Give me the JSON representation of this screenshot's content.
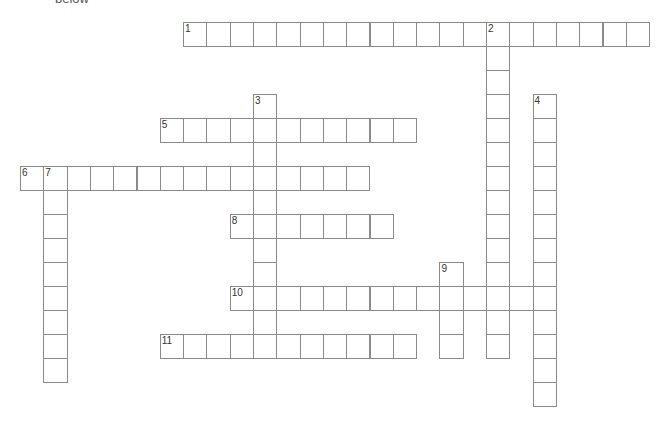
{
  "header": {
    "text": "below"
  },
  "grid": {
    "origin_x": 20,
    "origin_y": 22,
    "cell_w": 23.3,
    "cell_h": 24
  },
  "entries": [
    {
      "number": "1",
      "direction": "across",
      "row": 0,
      "col": 7,
      "length": 20
    },
    {
      "number": "2",
      "direction": "down",
      "row": 0,
      "col": 20,
      "length": 14
    },
    {
      "number": "3",
      "direction": "down",
      "row": 3,
      "col": 10,
      "length": 11
    },
    {
      "number": "4",
      "direction": "down",
      "row": 3,
      "col": 22,
      "length": 13
    },
    {
      "number": "5",
      "direction": "across",
      "row": 4,
      "col": 6,
      "length": 11
    },
    {
      "number": "6",
      "direction": "across",
      "row": 6,
      "col": 0,
      "length": 15
    },
    {
      "number": "7",
      "direction": "down",
      "row": 6,
      "col": 1,
      "length": 9
    },
    {
      "number": "8",
      "direction": "across",
      "row": 8,
      "col": 9,
      "length": 7
    },
    {
      "number": "9",
      "direction": "down",
      "row": 10,
      "col": 18,
      "length": 4
    },
    {
      "number": "10",
      "direction": "across",
      "row": 11,
      "col": 9,
      "length": 14
    },
    {
      "number": "11",
      "direction": "across",
      "row": 13,
      "col": 6,
      "length": 11
    }
  ]
}
